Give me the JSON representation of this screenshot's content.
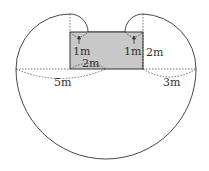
{
  "diagram": {
    "colors": {
      "shed_fill": "#c8c8c8",
      "line": "#333333",
      "background": "#ffffff"
    },
    "labels": {
      "top_left_radius": "1m",
      "top_right_radius": "1m",
      "right_side": "2m",
      "bottom_side": "2m",
      "left_radius": "5m",
      "right_radius": "3m"
    }
  }
}
